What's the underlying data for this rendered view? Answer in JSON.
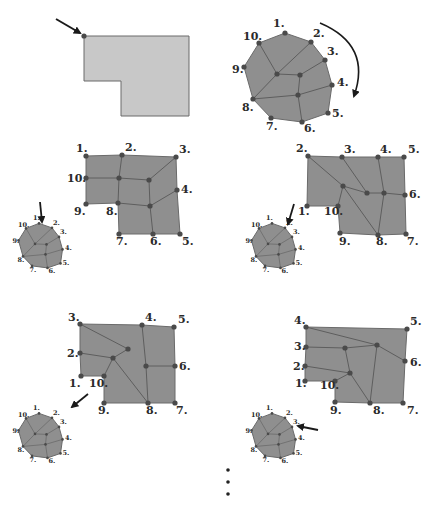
{
  "colors": {
    "fill_light": "#c8c8c8",
    "fill_mesh": "#8f8f8f",
    "stroke": "#6a6a6a",
    "edge": "#5e5e5e",
    "vertex": "#4a4a4a",
    "arrow": "#1a1a1a",
    "label": "#2a2a2a"
  },
  "boundary_polygon": {
    "points": [
      [
        84,
        36
      ],
      [
        189,
        36
      ],
      [
        189,
        116
      ],
      [
        121,
        116
      ],
      [
        121,
        81
      ],
      [
        84,
        81
      ]
    ],
    "start_vertex": [
      84,
      36
    ],
    "start_arrow": {
      "from": [
        56,
        19
      ],
      "to": [
        80,
        33
      ]
    }
  },
  "reference_octagon": {
    "vertices": [
      {
        "label": "1.",
        "x": 285,
        "y": 33,
        "lx": 273,
        "ly": 27
      },
      {
        "label": "2.",
        "x": 311,
        "y": 42,
        "lx": 313,
        "ly": 37
      },
      {
        "label": "3.",
        "x": 325,
        "y": 60,
        "lx": 327,
        "ly": 55
      },
      {
        "label": "4.",
        "x": 332,
        "y": 85,
        "lx": 337,
        "ly": 86
      },
      {
        "label": "5.",
        "x": 328,
        "y": 113,
        "lx": 332,
        "ly": 117
      },
      {
        "label": "6.",
        "x": 302,
        "y": 122,
        "lx": 304,
        "ly": 132
      },
      {
        "label": "7.",
        "x": 271,
        "y": 118,
        "lx": 266,
        "ly": 130
      },
      {
        "label": "8.",
        "x": 253,
        "y": 99,
        "lx": 242,
        "ly": 111
      },
      {
        "label": "9.",
        "x": 244,
        "y": 67,
        "lx": 232,
        "ly": 73
      },
      {
        "label": "10.",
        "x": 259,
        "y": 43,
        "lx": 243,
        "ly": 40
      }
    ],
    "inner": [
      [
        277,
        74
      ],
      [
        300,
        75
      ],
      [
        298,
        95
      ]
    ],
    "edges": [
      [
        [
          259,
          43
        ],
        [
          277,
          74
        ]
      ],
      [
        [
          311,
          42
        ],
        [
          277,
          74
        ]
      ],
      [
        [
          277,
          74
        ],
        [
          253,
          99
        ]
      ],
      [
        [
          277,
          74
        ],
        [
          300,
          75
        ]
      ],
      [
        [
          300,
          75
        ],
        [
          325,
          60
        ]
      ],
      [
        [
          300,
          75
        ],
        [
          298,
          95
        ]
      ],
      [
        [
          253,
          99
        ],
        [
          298,
          95
        ]
      ],
      [
        [
          298,
          95
        ],
        [
          332,
          85
        ]
      ],
      [
        [
          298,
          95
        ],
        [
          302,
          122
        ]
      ]
    ],
    "rotation_arrow": {
      "path": "M 320 23 Q 372 45 354 96",
      "direction": "clockwise"
    }
  },
  "meshes": [
    {
      "outline": [
        [
          86,
          156
        ],
        [
          122,
          155
        ],
        [
          176,
          157
        ],
        [
          177,
          190
        ],
        [
          180,
          234
        ],
        [
          153,
          234
        ],
        [
          119,
          234
        ],
        [
          118,
          203
        ],
        [
          86,
          204
        ],
        [
          86,
          178
        ]
      ],
      "vertices": [
        {
          "label": "1.",
          "x": 86,
          "y": 156,
          "lx": 76,
          "ly": 152
        },
        {
          "label": "2.",
          "x": 122,
          "y": 155,
          "lx": 125,
          "ly": 151
        },
        {
          "label": "3.",
          "x": 176,
          "y": 157,
          "lx": 179,
          "ly": 153
        },
        {
          "label": "4.",
          "x": 177,
          "y": 190,
          "lx": 181,
          "ly": 193
        },
        {
          "label": "5.",
          "x": 180,
          "y": 234,
          "lx": 182,
          "ly": 245
        },
        {
          "label": "6.",
          "x": 153,
          "y": 234,
          "lx": 150,
          "ly": 245
        },
        {
          "label": "7.",
          "x": 119,
          "y": 234,
          "lx": 116,
          "ly": 245
        },
        {
          "label": "8.",
          "x": 118,
          "y": 203,
          "lx": 106,
          "ly": 215
        },
        {
          "label": "9.",
          "x": 86,
          "y": 204,
          "lx": 74,
          "ly": 215
        },
        {
          "label": "10.",
          "x": 86,
          "y": 178,
          "lx": 67,
          "ly": 182
        }
      ],
      "inner": [
        [
          119,
          178
        ],
        [
          149,
          180
        ],
        [
          150,
          206
        ]
      ],
      "edges": [
        [
          [
            122,
            155
          ],
          [
            119,
            178
          ]
        ],
        [
          [
            86,
            178
          ],
          [
            119,
            178
          ]
        ],
        [
          [
            119,
            178
          ],
          [
            149,
            180
          ]
        ],
        [
          [
            149,
            180
          ],
          [
            176,
            157
          ]
        ],
        [
          [
            119,
            178
          ],
          [
            118,
            203
          ]
        ],
        [
          [
            149,
            180
          ],
          [
            150,
            206
          ]
        ],
        [
          [
            118,
            203
          ],
          [
            150,
            206
          ]
        ],
        [
          [
            150,
            206
          ],
          [
            177,
            190
          ]
        ],
        [
          [
            150,
            206
          ],
          [
            153,
            234
          ]
        ]
      ],
      "mini": {
        "cx": 42,
        "cy": 246,
        "scale": 0.5,
        "arrow": {
          "from": [
            40,
            202
          ],
          "to": [
            42,
            222
          ]
        },
        "arrow_target_label": "1."
      }
    },
    {
      "outline": [
        [
          308,
          156
        ],
        [
          342,
          157
        ],
        [
          378,
          157
        ],
        [
          404,
          157
        ],
        [
          405,
          195
        ],
        [
          406,
          234
        ],
        [
          378,
          235
        ],
        [
          340,
          233
        ],
        [
          338,
          206
        ],
        [
          307,
          206
        ]
      ],
      "vertices": [
        {
          "label": "1.",
          "x": 307,
          "y": 206,
          "lx": 298,
          "ly": 215
        },
        {
          "label": "2.",
          "x": 308,
          "y": 156,
          "lx": 296,
          "ly": 152
        },
        {
          "label": "3.",
          "x": 342,
          "y": 157,
          "lx": 344,
          "ly": 153
        },
        {
          "label": "4.",
          "x": 378,
          "y": 157,
          "lx": 380,
          "ly": 153
        },
        {
          "label": "5.",
          "x": 404,
          "y": 157,
          "lx": 408,
          "ly": 153
        },
        {
          "label": "6.",
          "x": 405,
          "y": 195,
          "lx": 409,
          "ly": 198
        },
        {
          "label": "7.",
          "x": 406,
          "y": 234,
          "lx": 407,
          "ly": 245
        },
        {
          "label": "8.",
          "x": 378,
          "y": 235,
          "lx": 376,
          "ly": 245
        },
        {
          "label": "9.",
          "x": 340,
          "y": 233,
          "lx": 339,
          "ly": 245
        },
        {
          "label": "10.",
          "x": 338,
          "y": 206,
          "lx": 324,
          "ly": 215
        }
      ],
      "inner": [
        [
          343,
          186
        ],
        [
          367,
          193
        ],
        [
          384,
          193
        ]
      ],
      "edges": [
        [
          [
            308,
            156
          ],
          [
            343,
            186
          ]
        ],
        [
          [
            342,
            157
          ],
          [
            367,
            193
          ]
        ],
        [
          [
            343,
            186
          ],
          [
            367,
            193
          ]
        ],
        [
          [
            367,
            193
          ],
          [
            384,
            193
          ]
        ],
        [
          [
            378,
            157
          ],
          [
            384,
            193
          ]
        ],
        [
          [
            384,
            193
          ],
          [
            405,
            195
          ]
        ],
        [
          [
            343,
            186
          ],
          [
            338,
            206
          ]
        ],
        [
          [
            343,
            186
          ],
          [
            378,
            235
          ]
        ],
        [
          [
            384,
            193
          ],
          [
            378,
            235
          ]
        ]
      ],
      "mini": {
        "cx": 275,
        "cy": 246,
        "scale": 0.5,
        "arrow": {
          "from": [
            294,
            204
          ],
          "to": [
            288,
            224
          ]
        },
        "arrow_target_label": "2."
      }
    },
    {
      "outline": [
        [
          80,
          324
        ],
        [
          142,
          325
        ],
        [
          174,
          327
        ],
        [
          175,
          366
        ],
        [
          175,
          403
        ],
        [
          148,
          403
        ],
        [
          104,
          403
        ],
        [
          104,
          376
        ],
        [
          81,
          376
        ],
        [
          80,
          353
        ]
      ],
      "vertices": [
        {
          "label": "1.",
          "x": 81,
          "y": 376,
          "lx": 69,
          "ly": 387
        },
        {
          "label": "2.",
          "x": 80,
          "y": 353,
          "lx": 67,
          "ly": 357
        },
        {
          "label": "3.",
          "x": 80,
          "y": 324,
          "lx": 68,
          "ly": 321
        },
        {
          "label": "4.",
          "x": 142,
          "y": 325,
          "lx": 145,
          "ly": 321
        },
        {
          "label": "5.",
          "x": 174,
          "y": 327,
          "lx": 178,
          "ly": 323
        },
        {
          "label": "6.",
          "x": 175,
          "y": 366,
          "lx": 179,
          "ly": 370
        },
        {
          "label": "7.",
          "x": 175,
          "y": 403,
          "lx": 176,
          "ly": 414
        },
        {
          "label": "8.",
          "x": 148,
          "y": 403,
          "lx": 146,
          "ly": 414
        },
        {
          "label": "9.",
          "x": 104,
          "y": 403,
          "lx": 98,
          "ly": 414
        },
        {
          "label": "10.",
          "x": 104,
          "y": 376,
          "lx": 89,
          "ly": 387
        }
      ],
      "inner": [
        [
          128,
          349
        ],
        [
          113,
          358
        ],
        [
          146,
          366
        ]
      ],
      "edges": [
        [
          [
            80,
            324
          ],
          [
            128,
            349
          ]
        ],
        [
          [
            128,
            349
          ],
          [
            113,
            358
          ]
        ],
        [
          [
            80,
            353
          ],
          [
            113,
            358
          ]
        ],
        [
          [
            113,
            358
          ],
          [
            104,
            376
          ]
        ],
        [
          [
            113,
            358
          ],
          [
            148,
            403
          ]
        ],
        [
          [
            142,
            325
          ],
          [
            146,
            366
          ]
        ],
        [
          [
            146,
            366
          ],
          [
            175,
            366
          ]
        ],
        [
          [
            146,
            366
          ],
          [
            148,
            403
          ]
        ]
      ],
      "mini": {
        "cx": 42,
        "cy": 436,
        "scale": 0.5,
        "arrow": {
          "from": [
            88,
            394
          ],
          "to": [
            72,
            407
          ]
        },
        "arrow_target_label": "3."
      }
    },
    {
      "outline": [
        [
          306,
          327
        ],
        [
          407,
          329
        ],
        [
          405,
          361
        ],
        [
          403,
          403
        ],
        [
          370,
          403
        ],
        [
          335,
          402
        ],
        [
          335,
          381
        ],
        [
          305,
          381
        ],
        [
          305,
          366
        ],
        [
          306,
          347
        ]
      ],
      "vertices": [
        {
          "label": "1.",
          "x": 305,
          "y": 381,
          "lx": 295,
          "ly": 387
        },
        {
          "label": "2.",
          "x": 305,
          "y": 366,
          "lx": 293,
          "ly": 370
        },
        {
          "label": "3.",
          "x": 306,
          "y": 347,
          "lx": 294,
          "ly": 350
        },
        {
          "label": "4.",
          "x": 306,
          "y": 327,
          "lx": 294,
          "ly": 324
        },
        {
          "label": "5.",
          "x": 407,
          "y": 329,
          "lx": 410,
          "ly": 325
        },
        {
          "label": "6.",
          "x": 405,
          "y": 361,
          "lx": 410,
          "ly": 366
        },
        {
          "label": "7.",
          "x": 403,
          "y": 403,
          "lx": 407,
          "ly": 414
        },
        {
          "label": "8.",
          "x": 370,
          "y": 403,
          "lx": 373,
          "ly": 414
        },
        {
          "label": "9.",
          "x": 335,
          "y": 402,
          "lx": 330,
          "ly": 414
        },
        {
          "label": "10.",
          "x": 335,
          "y": 381,
          "lx": 320,
          "ly": 389
        }
      ],
      "inner": [
        [
          345,
          348
        ],
        [
          377,
          345
        ],
        [
          350,
          373
        ]
      ],
      "edges": [
        [
          [
            306,
            327
          ],
          [
            377,
            345
          ]
        ],
        [
          [
            377,
            345
          ],
          [
            405,
            361
          ]
        ],
        [
          [
            306,
            347
          ],
          [
            345,
            348
          ]
        ],
        [
          [
            345,
            348
          ],
          [
            377,
            345
          ]
        ],
        [
          [
            345,
            348
          ],
          [
            350,
            373
          ]
        ],
        [
          [
            305,
            366
          ],
          [
            350,
            373
          ]
        ],
        [
          [
            350,
            373
          ],
          [
            335,
            381
          ]
        ],
        [
          [
            350,
            373
          ],
          [
            370,
            403
          ]
        ],
        [
          [
            377,
            345
          ],
          [
            370,
            403
          ]
        ]
      ],
      "mini": {
        "cx": 275,
        "cy": 436,
        "scale": 0.5,
        "arrow": {
          "from": [
            318,
            430
          ],
          "to": [
            298,
            426
          ]
        },
        "arrow_target_label": "4."
      }
    }
  ],
  "continuation": {
    "symbol": "vertical-ellipsis",
    "dots": [
      [
        228,
        470
      ],
      [
        228,
        482
      ],
      [
        228,
        494
      ]
    ]
  }
}
